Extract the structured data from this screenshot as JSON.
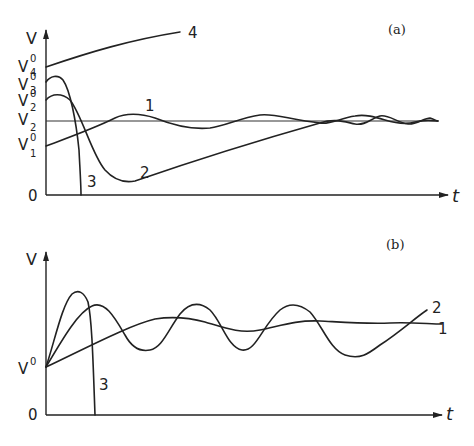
{
  "panels": [
    {
      "id": "a",
      "panel_label": "(a)",
      "y_axis_label": "V",
      "x_axis_label": "t",
      "y_ticks": {
        "v4": {
          "base": "V",
          "sup": "0",
          "sub": "4"
        },
        "v3": {
          "base": "V",
          "sup": "0",
          "sub": "3"
        },
        "v2_0": {
          "base": "V",
          "sup": "0",
          "sub": "2"
        },
        "v2": {
          "base": "V",
          "sub": "2"
        },
        "v1": {
          "base": "V",
          "sup": "0",
          "sub": "1"
        },
        "zero": "0"
      },
      "curve_labels": {
        "c1": "1",
        "c2": "2",
        "c3": "3",
        "c4": "4"
      }
    },
    {
      "id": "b",
      "panel_label": "(b)",
      "y_axis_label": "V",
      "x_axis_label": "t",
      "y_ticks": {
        "v0": {
          "base": "V",
          "sup": "0"
        },
        "zero": "0"
      },
      "curve_labels": {
        "c1": "1",
        "c2": "2",
        "c3": "3"
      }
    }
  ]
}
